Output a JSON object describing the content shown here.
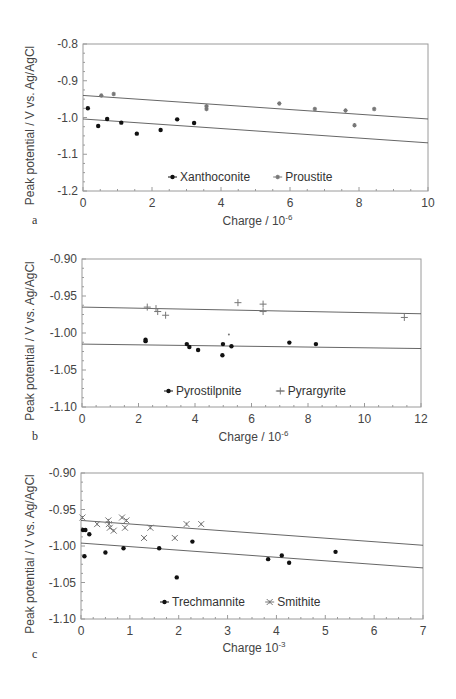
{
  "figure": {
    "ylabel_common": "Peak potential / V vs. Ag/AgCl"
  },
  "chart_data": [
    {
      "panel": "a",
      "type": "scatter",
      "title": "",
      "xlabel": "Charge / 10",
      "xlabel_sup": "-6",
      "ylabel": "Peak potential / V vs. Ag/AgCl",
      "xlim": [
        0,
        10
      ],
      "ylim": [
        -1.2,
        -0.8
      ],
      "xticks": [
        0,
        2,
        4,
        6,
        8,
        10
      ],
      "xtick_labels": [
        "0",
        "2",
        "4",
        "6",
        "8",
        "10"
      ],
      "yticks": [
        -0.8,
        -0.9,
        -1.0,
        -1.1,
        -1.2
      ],
      "ytick_labels": [
        "-0.8",
        "-0.9",
        "-1.0",
        "-1.1",
        "-1.2"
      ],
      "grid": false,
      "legend_position": "lower center",
      "frame": {
        "left": 83,
        "right": 428,
        "top": 44,
        "bottom": 191
      },
      "series": [
        {
          "name": "Xanthoconite",
          "marker": "dot",
          "x": [
            0.14,
            0.44,
            0.7,
            1.11,
            1.56,
            2.25,
            2.73,
            3.22
          ],
          "y": [
            -0.975,
            -1.023,
            -1.004,
            -1.014,
            -1.044,
            -1.034,
            -1.005,
            -1.015
          ],
          "fit": {
            "x": [
              0,
              10
            ],
            "y": [
              -1.004,
              -1.069
            ]
          }
        },
        {
          "name": "Proustite",
          "marker": "star",
          "x": [
            0.53,
            0.89,
            3.58,
            3.58,
            5.69,
            6.72,
            7.61,
            7.87,
            8.44
          ],
          "y": [
            -0.94,
            -0.936,
            -0.969,
            -0.977,
            -0.962,
            -0.977,
            -0.981,
            -1.021,
            -0.977
          ],
          "fit": {
            "x": [
              0,
              10
            ],
            "y": [
              -0.94,
              -1.004
            ]
          }
        }
      ],
      "legend": {
        "x": 168,
        "y": 181
      }
    },
    {
      "panel": "b",
      "type": "scatter",
      "title": "",
      "xlabel": "Charge / 10",
      "xlabel_sup": "-6",
      "ylabel": "Peak potential / V vs. Ag/AgCl",
      "xlim": [
        0,
        12
      ],
      "ylim": [
        -1.1,
        -0.9
      ],
      "xticks": [
        0,
        2,
        4,
        6,
        8,
        10,
        12
      ],
      "xtick_labels": [
        "0",
        "2",
        "4",
        "6",
        "8",
        "10",
        "12"
      ],
      "yticks": [
        -0.9,
        -0.95,
        -1.0,
        -1.05,
        -1.1
      ],
      "ytick_labels": [
        "-0.90",
        "-0.95",
        "-1.00",
        "-1.05",
        "-1.10"
      ],
      "grid": false,
      "legend_position": "lower center",
      "frame": {
        "left": 82,
        "right": 421,
        "top": 259,
        "bottom": 407
      },
      "series": [
        {
          "name": "Pyrostilpnite",
          "marker": "dot",
          "x": [
            2.25,
            2.25,
            3.71,
            3.8,
            4.11,
            4.99,
            4.97,
            5.29,
            7.34,
            8.28
          ],
          "y": [
            -1.009,
            -1.011,
            -1.015,
            -1.019,
            -1.023,
            -1.015,
            -1.03,
            -1.018,
            -1.013,
            -1.015
          ],
          "fit": {
            "x": [
              0,
              12
            ],
            "y": [
              -1.015,
              -1.021
            ]
          }
        },
        {
          "name": "Pyrargyrite",
          "marker": "plus",
          "x": [
            2.31,
            2.62,
            2.68,
            2.96,
            5.52,
            6.41,
            6.41,
            11.41
          ],
          "y": [
            -0.965,
            -0.967,
            -0.971,
            -0.976,
            -0.959,
            -0.961,
            -0.971,
            -0.979
          ],
          "fit": {
            "x": [
              0,
              12
            ],
            "y": [
              -0.965,
              -0.974
            ]
          }
        }
      ],
      "extra_marks": [
        {
          "x": 5.2,
          "y": -1.002,
          "marker": "small-dot"
        }
      ],
      "legend": {
        "x": 164,
        "y": 395
      }
    },
    {
      "panel": "c",
      "type": "scatter",
      "title": "",
      "xlabel": "Charge 10",
      "xlabel_sup": "-3",
      "ylabel": "Peak potential / V vs. Ag/AgCl",
      "xlim": [
        0,
        7
      ],
      "ylim": [
        -1.1,
        -0.9
      ],
      "xticks": [
        0,
        1,
        2,
        3,
        4,
        5,
        6,
        7
      ],
      "xtick_labels": [
        "0",
        "1",
        "2",
        "3",
        "4",
        "5",
        "6",
        "7"
      ],
      "yticks": [
        -0.9,
        -0.95,
        -1.0,
        -1.05,
        -1.1
      ],
      "ytick_labels": [
        "-0.90",
        "-0.95",
        "-1.00",
        "-1.05",
        "-1.10"
      ],
      "grid": false,
      "legend_position": "lower center",
      "frame": {
        "left": 81,
        "right": 423,
        "top": 473,
        "bottom": 619
      },
      "series": [
        {
          "name": "Trechmannite",
          "marker": "dot",
          "x": [
            0.04,
            0.09,
            0.07,
            0.17,
            0.5,
            0.87,
            1.6,
            1.96,
            2.28,
            3.83,
            4.11,
            4.26,
            5.21
          ],
          "y": [
            -0.978,
            -0.978,
            -1.014,
            -0.984,
            -1.009,
            -1.003,
            -1.003,
            -1.043,
            -0.994,
            -1.018,
            -1.013,
            -1.023,
            -1.008
          ],
          "fit": {
            "x": [
              0,
              7
            ],
            "y": [
              -0.996,
              -1.03
            ]
          }
        },
        {
          "name": "Smithite",
          "marker": "xstar",
          "x": [
            0.03,
            0.33,
            0.56,
            0.57,
            0.59,
            0.67,
            0.84,
            0.93,
            0.9,
            1.29,
            1.42,
            1.92,
            2.16,
            2.46
          ],
          "y": [
            -0.961,
            -0.97,
            -0.965,
            -0.97,
            -0.975,
            -0.979,
            -0.961,
            -0.965,
            -0.975,
            -0.989,
            -0.975,
            -0.989,
            -0.97,
            -0.97
          ],
          "fit": {
            "x": [
              0,
              7
            ],
            "y": [
              -0.965,
              -0.999
            ]
          }
        }
      ],
      "legend": {
        "x": 160,
        "y": 606
      }
    }
  ],
  "layout_labels": {
    "a": {
      "label_x": 32,
      "label_y": 224,
      "xtitle_y": 225,
      "ytitle_x": 34
    },
    "b": {
      "label_x": 32,
      "label_y": 440,
      "xtitle_y": 441,
      "ytitle_x": 34
    },
    "c": {
      "label_x": 32,
      "label_y": 658,
      "xtitle_y": 652,
      "ytitle_x": 34
    }
  },
  "colors": {
    "axis": "#9a9a9a",
    "fit_line": "#555555",
    "marker_dark": "#111111",
    "marker_light": "#777777",
    "text": "#444444"
  }
}
